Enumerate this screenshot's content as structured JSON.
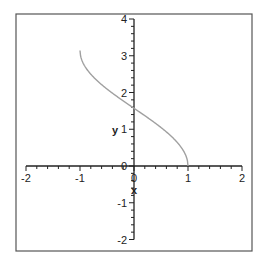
{
  "chart_data": {
    "type": "line",
    "title": "",
    "xlabel": "x",
    "ylabel": "y",
    "xlim": [
      -2,
      2
    ],
    "ylim": [
      -2,
      4
    ],
    "grid": false,
    "legend": null,
    "x_ticks": [
      -2,
      -1,
      0,
      1,
      2
    ],
    "y_ticks": [
      -2,
      -1,
      0,
      1,
      2,
      3,
      4
    ],
    "x_tick_labels": [
      "-2",
      "-1",
      "0",
      "1",
      "2"
    ],
    "y_tick_labels": [
      "-2",
      "-1",
      "0",
      "1",
      "2",
      "3",
      "4"
    ],
    "series": [
      {
        "name": "arccos(x)",
        "color": "#a0a0a0",
        "x": [
          -1.0,
          -0.98,
          -0.95,
          -0.9,
          -0.8,
          -0.7,
          -0.6,
          -0.5,
          -0.4,
          -0.3,
          -0.2,
          -0.1,
          0.0,
          0.1,
          0.2,
          0.3,
          0.4,
          0.5,
          0.6,
          0.7,
          0.8,
          0.9,
          0.95,
          0.98,
          1.0
        ],
        "y": [
          3.1416,
          2.9413,
          2.824,
          2.6906,
          2.4981,
          2.3462,
          2.2143,
          2.0944,
          1.9823,
          1.8755,
          1.7722,
          1.671,
          1.5708,
          1.4706,
          1.3694,
          1.2661,
          1.1593,
          1.0472,
          0.9273,
          0.7954,
          0.6435,
          0.451,
          0.3176,
          0.2003,
          0.0
        ]
      }
    ]
  },
  "axes": {
    "x_label": "x",
    "y_label": "y",
    "axis_color": "#222222",
    "frame_color": "#555555"
  }
}
